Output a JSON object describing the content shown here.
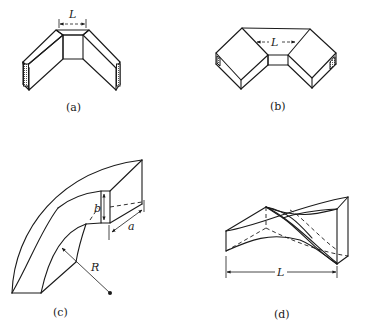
{
  "figure": {
    "panels": [
      {
        "id": "a",
        "caption": "(a)",
        "type": "E-plane corner bend",
        "dimension_label": "L"
      },
      {
        "id": "b",
        "caption": "(b)",
        "type": "H-plane corner bend",
        "dimension_label": "L"
      },
      {
        "id": "c",
        "caption": "(c)",
        "type": "smooth curved bend",
        "dimension_labels": {
          "height": "b",
          "width": "a",
          "radius": "R"
        }
      },
      {
        "id": "d",
        "caption": "(d)",
        "type": "waveguide twist",
        "dimension_label": "L"
      }
    ]
  },
  "labels": {
    "a_caption": "(a)",
    "a_L": "L",
    "b_caption": "(b)",
    "b_L": "L",
    "c_caption": "(c)",
    "c_b": "b",
    "c_a": "a",
    "c_R": "R",
    "d_caption": "(d)",
    "d_L": "L"
  },
  "colors": {
    "ink": "#1a1a1a",
    "background": "#ffffff"
  }
}
